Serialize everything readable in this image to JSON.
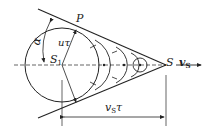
{
  "diagram": {
    "labels": {
      "P": "P",
      "alpha": "α",
      "u_tau": "uτ",
      "S1_main": "S",
      "S1_sub": "1",
      "S": "S",
      "vS_main": "v",
      "vS_sub": "S",
      "vS_tau_main": "v",
      "vS_tau_sub": "S",
      "vS_tau_tail": "τ"
    },
    "colors": {
      "stroke": "#222222",
      "background": "#ffffff"
    }
  }
}
